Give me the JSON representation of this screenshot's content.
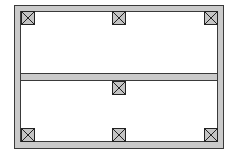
{
  "diagram": {
    "type": "structural-floor-plan",
    "colors": {
      "background": "#ffffff",
      "beam_fill": "#cacaca",
      "beam_stroke": "#3a3a3a",
      "column_fill": "#c4c4c4",
      "column_stroke": "#222222"
    },
    "frame": {
      "x": 14,
      "y": 5,
      "width": 209,
      "height": 143,
      "thickness": 6
    },
    "middle_beam": {
      "x": 20,
      "y": 73,
      "width": 197,
      "height": 7
    },
    "columns": [
      {
        "id": "top-left",
        "x": 21,
        "y": 11
      },
      {
        "id": "top-center",
        "x": 112,
        "y": 11
      },
      {
        "id": "top-right",
        "x": 204,
        "y": 11
      },
      {
        "id": "middle-center",
        "x": 112,
        "y": 81
      },
      {
        "id": "bottom-left",
        "x": 21,
        "y": 128
      },
      {
        "id": "bottom-center",
        "x": 112,
        "y": 128
      },
      {
        "id": "bottom-right",
        "x": 204,
        "y": 128
      }
    ],
    "column_size": 13
  }
}
